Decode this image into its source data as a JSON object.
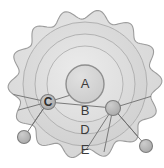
{
  "diagram": {
    "title": "",
    "background_color": "#ffffff",
    "outline_color": "#9a9a9a",
    "cloud": {
      "name": "scalloped-outer-boundary",
      "fill": "#dcdcdc",
      "stroke": "#9c9c9c",
      "center": {
        "x": 85,
        "y": 84
      },
      "base_radius": 72,
      "lobe_count": 14,
      "lobe_amplitude": 5
    },
    "rings": [
      {
        "id": "ring-e",
        "label": "E",
        "label_x": 85,
        "label_y": 151,
        "radius": 62,
        "fill": "#d2d2d2",
        "stroke": "#a8a8a8"
      },
      {
        "id": "ring-d",
        "label": "D",
        "label_x": 85,
        "label_y": 131,
        "radius": 50,
        "fill": "#d8d8d8",
        "stroke": "#ababab"
      },
      {
        "id": "ring-b",
        "label": "B",
        "label_x": 85,
        "label_y": 112,
        "radius": 38,
        "fill": "#dedede",
        "stroke": "#aeaeae"
      },
      {
        "id": "ring-a",
        "label": "A",
        "label_x": 85,
        "label_y": 85,
        "radius": 19,
        "fill": "#d6d6d6",
        "stroke": "#8f8f8f"
      }
    ],
    "nodes": [
      {
        "id": "node-c",
        "label": "C",
        "x": 48,
        "y": 102,
        "radius": 7.5,
        "fill": "#bdbdbd",
        "stroke": "#7d7d7d",
        "has_label": true
      },
      {
        "id": "node-right",
        "label": "",
        "x": 113,
        "y": 108,
        "radius": 7.5,
        "fill": "#b5b5b5",
        "stroke": "#7d7d7d",
        "has_label": false
      },
      {
        "id": "node-bottom-left",
        "label": "",
        "x": 24,
        "y": 137,
        "radius": 6.5,
        "fill": "#ababab",
        "stroke": "#7d7d7d",
        "has_label": false
      },
      {
        "id": "node-bottom-right",
        "label": "",
        "x": 146,
        "y": 146,
        "radius": 6.5,
        "fill": "#ababab",
        "stroke": "#7d7d7d",
        "has_label": false
      }
    ],
    "connectors": [
      {
        "id": "c-to-left-upper",
        "x1": 48,
        "y1": 102,
        "x2": 2,
        "y2": 92
      },
      {
        "id": "c-to-left-lower",
        "x1": 48,
        "y1": 102,
        "x2": 4,
        "y2": 114
      },
      {
        "id": "c-to-bottom-left",
        "x1": 48,
        "y1": 102,
        "x2": 24,
        "y2": 137
      },
      {
        "id": "c-to-node-right",
        "x1": 48,
        "y1": 102,
        "x2": 113,
        "y2": 108
      },
      {
        "id": "c-to-center",
        "x1": 48,
        "y1": 102,
        "x2": 74,
        "y2": 94
      },
      {
        "id": "right-to-top-right",
        "x1": 113,
        "y1": 108,
        "x2": 162,
        "y2": 93
      },
      {
        "id": "right-to-bottom-right",
        "x1": 113,
        "y1": 108,
        "x2": 146,
        "y2": 146
      },
      {
        "id": "right-to-bottom",
        "x1": 113,
        "y1": 108,
        "x2": 104,
        "y2": 152
      },
      {
        "id": "right-to-lower-left",
        "x1": 113,
        "y1": 108,
        "x2": 86,
        "y2": 150
      }
    ]
  }
}
